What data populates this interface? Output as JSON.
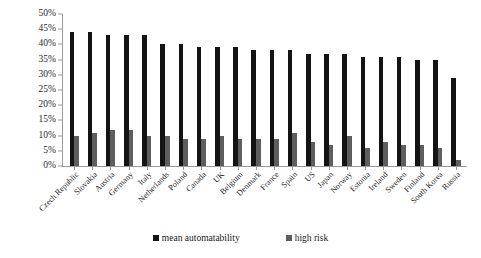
{
  "chart_data": {
    "type": "bar",
    "title": "",
    "subtitle": "",
    "xlabel": "",
    "ylabel": "",
    "ylim": [
      0,
      50
    ],
    "ytick_step": 5,
    "ytick_labels": [
      "0%",
      "5%",
      "10%",
      "15%",
      "20%",
      "25%",
      "30%",
      "35%",
      "40%",
      "45%",
      "50%"
    ],
    "ytick_values": [
      0,
      5,
      10,
      15,
      20,
      25,
      30,
      35,
      40,
      45,
      50
    ],
    "grid": false,
    "legend_position": "bottom-center",
    "categories": [
      "Czech Republic",
      "Slovakia",
      "Austria",
      "Germany",
      "Italy",
      "Netherlands",
      "Poland",
      "Canada",
      "UK",
      "Belgium",
      "Denmark",
      "France",
      "Spain",
      "US",
      "Japan",
      "Norway",
      "Estonia",
      "Ireland",
      "Sweden",
      "Finland",
      "South Korea",
      "Russia"
    ],
    "series": [
      {
        "name": "mean automatability",
        "color": "#141414",
        "values": [
          44,
          44,
          43,
          43,
          43,
          40,
          40,
          39,
          39,
          39,
          38,
          38,
          38,
          37,
          37,
          37,
          36,
          36,
          36,
          35,
          35,
          29
        ]
      },
      {
        "name": "high risk",
        "color": "#5e5e5e",
        "values": [
          10,
          11,
          12,
          12,
          10,
          10,
          9,
          9,
          10,
          9,
          9,
          9,
          11,
          8,
          7,
          10,
          6,
          8,
          7,
          7,
          6,
          2
        ]
      }
    ]
  },
  "legend": {
    "items": [
      {
        "label": "mean automatability",
        "color": "#141414"
      },
      {
        "label": "high risk",
        "color": "#5e5e5e"
      }
    ]
  }
}
